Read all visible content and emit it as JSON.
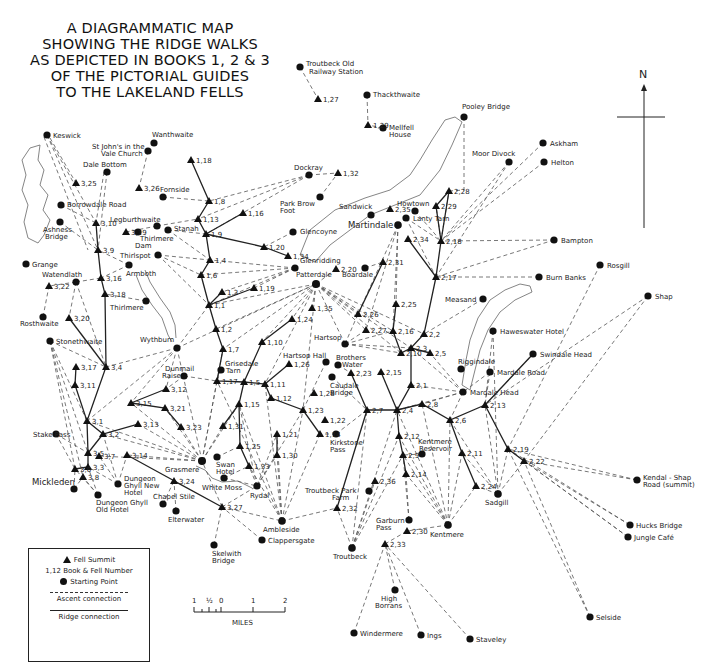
{
  "title": {
    "lines": [
      "A DIAGRAMMATIC MAP",
      "SHOWING THE RIDGE WALKS",
      "AS DEPICTED IN BOOKS 1, 2 & 3",
      "OF THE PICTORIAL GUIDES",
      "TO THE LAKELAND FELLS"
    ]
  },
  "compass": {
    "label": "N",
    "icon": "north-arrow-icon"
  },
  "legend": {
    "fell_summit": "Fell Summit",
    "book_fell_number": "1,12 Book & Fell Number",
    "starting_point": "Starting Point",
    "ascent_connection": "Ascent connection",
    "ridge_connection": "Ridge connection"
  },
  "scale": {
    "ticks": [
      "1",
      "½",
      "0",
      "1",
      "2"
    ],
    "unit": "MILES"
  },
  "colors": {
    "ink": "#111111",
    "paper": "#ffffff",
    "dash": "#555555",
    "water": "#777777"
  },
  "starting_points": [
    {
      "id": "troutbeck_old_station",
      "name": "Troutbeck Old Railway Station",
      "x": 300,
      "y": 67
    },
    {
      "id": "thackthwaite",
      "name": "Thackthwaite",
      "x": 367,
      "y": 95
    },
    {
      "id": "mellfell_house",
      "name": "Mellfell House",
      "x": 383,
      "y": 128
    },
    {
      "id": "pooley_bridge",
      "name": "Pooley Bridge",
      "x": 464,
      "y": 117
    },
    {
      "id": "askham",
      "name": "Askham",
      "x": 543,
      "y": 143
    },
    {
      "id": "helton",
      "name": "Helton",
      "x": 544,
      "y": 162
    },
    {
      "id": "moor_divock",
      "name": "Moor Divock",
      "x": 509,
      "y": 162
    },
    {
      "id": "keswick",
      "name": "Keswick",
      "x": 47,
      "y": 135
    },
    {
      "id": "wanthwaite",
      "name": "Wanthwaite",
      "x": 154,
      "y": 143
    },
    {
      "id": "st_johns",
      "name": "St John's in the Vale Church",
      "x": 148,
      "y": 151
    },
    {
      "id": "dale_bottom",
      "name": "Dale Bottom",
      "x": 107,
      "y": 172
    },
    {
      "id": "fornside",
      "name": "Fornside",
      "x": 163,
      "y": 197
    },
    {
      "id": "dockray",
      "name": "Dockray",
      "x": 309,
      "y": 175
    },
    {
      "id": "park_brow_foot",
      "name": "Park Brow Foot",
      "x": 320,
      "y": 197
    },
    {
      "id": "borrowdale_road",
      "name": "Borrowdale Road",
      "x": 61,
      "y": 205
    },
    {
      "id": "ashness_bridge",
      "name": "Ashness Bridge",
      "x": 60,
      "y": 222
    },
    {
      "id": "legburthwaite",
      "name": "Legburthwaite",
      "x": 157,
      "y": 226
    },
    {
      "id": "stanah",
      "name": "Stanah",
      "x": 168,
      "y": 230
    },
    {
      "id": "thirlmere_dam",
      "name": "Thirlmere Dam",
      "x": 138,
      "y": 232
    },
    {
      "id": "thirlspot",
      "name": "Thirlspot",
      "x": 158,
      "y": 255
    },
    {
      "id": "armboth",
      "name": "Armboth",
      "x": 129,
      "y": 265
    },
    {
      "id": "grange",
      "name": "Grange",
      "x": 26,
      "y": 264
    },
    {
      "id": "watendlath",
      "name": "Watendlath",
      "x": 76,
      "y": 282
    },
    {
      "id": "thirlmere",
      "name": "Thirlmere",
      "x": 146,
      "y": 301
    },
    {
      "id": "rosthwaite",
      "name": "Rosthwaite",
      "x": 43,
      "y": 317
    },
    {
      "id": "stonethwaite",
      "name": "Stonethwaite",
      "x": 50,
      "y": 341
    },
    {
      "id": "wythburn",
      "name": "Wythburn",
      "x": 177,
      "y": 348
    },
    {
      "id": "dunmail_raise",
      "name": "Dunmail Raise",
      "x": 184,
      "y": 376
    },
    {
      "id": "glencoyne",
      "name": "Glencoyne",
      "x": 293,
      "y": 232
    },
    {
      "id": "glenridding",
      "name": "Glenridding",
      "x": 295,
      "y": 268
    },
    {
      "id": "patterdale",
      "name": "Patterdale",
      "x": 316,
      "y": 284
    },
    {
      "id": "sandwick",
      "name": "Sandwick",
      "x": 371,
      "y": 215
    },
    {
      "id": "martindale",
      "name": "Martindale",
      "x": 398,
      "y": 225
    },
    {
      "id": "howtown",
      "name": "Howtown",
      "x": 415,
      "y": 211
    },
    {
      "id": "lanty_tarn",
      "name": "Lanty Tarn",
      "x": 406,
      "y": 218
    },
    {
      "id": "boardale",
      "name": "Boardale",
      "x": 365,
      "y": 268
    },
    {
      "id": "bampton",
      "name": "Bampton",
      "x": 554,
      "y": 240
    },
    {
      "id": "burn_banks",
      "name": "Burn Banks",
      "x": 539,
      "y": 277
    },
    {
      "id": "rosgill",
      "name": "Rosgill",
      "x": 600,
      "y": 265
    },
    {
      "id": "shap",
      "name": "Shap",
      "x": 648,
      "y": 296
    },
    {
      "id": "measand",
      "name": "Measand",
      "x": 483,
      "y": 299
    },
    {
      "id": "haweswater_hotel",
      "name": "Haweswater Hotel",
      "x": 493,
      "y": 331
    },
    {
      "id": "swindale_head",
      "name": "Swindale Head",
      "x": 533,
      "y": 354
    },
    {
      "id": "riggindale",
      "name": "Riggindale",
      "x": 461,
      "y": 369
    },
    {
      "id": "mardale_road",
      "name": "Mardale Road",
      "x": 490,
      "y": 372
    },
    {
      "id": "mardale_head",
      "name": "Mardale Head",
      "x": 463,
      "y": 392
    },
    {
      "id": "hartsop",
      "name": "Hartsop",
      "x": 345,
      "y": 344
    },
    {
      "id": "hartsop_hall",
      "name": "Hartsop Hall",
      "x": 326,
      "y": 362
    },
    {
      "id": "brothers_water",
      "name": "Brothers Water",
      "x": 338,
      "y": 365
    },
    {
      "id": "caudale_bridge",
      "name": "Caudale Bridge",
      "x": 332,
      "y": 377
    },
    {
      "id": "grisedale_tarn",
      "name": "Grisedale Tarn",
      "x": 221,
      "y": 370
    },
    {
      "id": "kirkstone_pass",
      "name": "Kirkstone Pass",
      "x": 336,
      "y": 434
    },
    {
      "id": "kentmere_reservoir",
      "name": "Kentmere Reservoir",
      "x": 422,
      "y": 454
    },
    {
      "id": "stake_pass",
      "name": "Stake Pass",
      "x": 56,
      "y": 434
    },
    {
      "id": "grasmere",
      "name": "Grasmere",
      "x": 202,
      "y": 461
    },
    {
      "id": "swan_hotel",
      "name": "Swan Hotel",
      "x": 217,
      "y": 457
    },
    {
      "id": "white_moss",
      "name": "White Moss",
      "x": 224,
      "y": 478
    },
    {
      "id": "rydal",
      "name": "Rydal",
      "x": 257,
      "y": 486
    },
    {
      "id": "mickleden",
      "name": "Mickleden",
      "x": 74,
      "y": 489
    },
    {
      "id": "dungeon_ghyll_new",
      "name": "Dungeon Ghyll New Hotel",
      "x": 118,
      "y": 484
    },
    {
      "id": "dungeon_ghyll_old",
      "name": "Dungeon Ghyll Old Hotel",
      "x": 98,
      "y": 495
    },
    {
      "id": "chapel_stile",
      "name": "Chapel Stile",
      "x": 163,
      "y": 504
    },
    {
      "id": "elterwater",
      "name": "Elterwater",
      "x": 176,
      "y": 511
    },
    {
      "id": "troutbeck_park",
      "name": "Troutbeck Park Farm",
      "x": 369,
      "y": 491
    },
    {
      "id": "sadgill",
      "name": "Sadgill",
      "x": 498,
      "y": 494
    },
    {
      "id": "garburn_pass",
      "name": "Garburn Pass",
      "x": 409,
      "y": 520
    },
    {
      "id": "kentmere",
      "name": "Kentmere",
      "x": 448,
      "y": 525
    },
    {
      "id": "ambleside",
      "name": "Ambleside",
      "x": 282,
      "y": 521
    },
    {
      "id": "clappersgate",
      "name": "Clappersgate",
      "x": 262,
      "y": 540
    },
    {
      "id": "troutbeck",
      "name": "Troutbeck",
      "x": 352,
      "y": 548
    },
    {
      "id": "skelwith_bridge",
      "name": "Skelwith Bridge",
      "x": 214,
      "y": 545
    },
    {
      "id": "kendal_shap",
      "name": "Kendal - Shap Road (summit)",
      "x": 637,
      "y": 480
    },
    {
      "id": "hucks_bridge",
      "name": "Hucks Bridge",
      "x": 630,
      "y": 525
    },
    {
      "id": "jungle_cafe",
      "name": "Jungle Café",
      "x": 628,
      "y": 537
    },
    {
      "id": "high_borrans",
      "name": "High Borrans",
      "x": 395,
      "y": 590
    },
    {
      "id": "windermere",
      "name": "Windermere",
      "x": 354,
      "y": 633
    },
    {
      "id": "ings",
      "name": "Ings",
      "x": 421,
      "y": 635
    },
    {
      "id": "staveley",
      "name": "Staveley",
      "x": 470,
      "y": 639
    },
    {
      "id": "selside",
      "name": "Selside",
      "x": 590,
      "y": 617
    }
  ],
  "fell_summits": [
    {
      "id": "1,27",
      "x": 318,
      "y": 99
    },
    {
      "id": "1,29",
      "x": 368,
      "y": 125
    },
    {
      "id": "2,28",
      "x": 449,
      "y": 191
    },
    {
      "id": "2,29",
      "x": 436,
      "y": 206
    },
    {
      "id": "2,35",
      "x": 390,
      "y": 209
    },
    {
      "id": "1,32",
      "x": 338,
      "y": 173
    },
    {
      "id": "1,18",
      "x": 191,
      "y": 160
    },
    {
      "id": "3,25",
      "x": 76,
      "y": 183
    },
    {
      "id": "3,26",
      "x": 139,
      "y": 188
    },
    {
      "id": "1,8",
      "x": 209,
      "y": 201
    },
    {
      "id": "1,16",
      "x": 243,
      "y": 213
    },
    {
      "id": "1,13",
      "x": 198,
      "y": 219
    },
    {
      "id": "1,9",
      "x": 206,
      "y": 234
    },
    {
      "id": "3,10",
      "x": 96,
      "y": 223
    },
    {
      "id": "3,19",
      "x": 126,
      "y": 232
    },
    {
      "id": "3,9",
      "x": 98,
      "y": 250
    },
    {
      "id": "1,4",
      "x": 210,
      "y": 260
    },
    {
      "id": "1,20",
      "x": 264,
      "y": 247
    },
    {
      "id": "1,34",
      "x": 288,
      "y": 256
    },
    {
      "id": "3,16",
      "x": 101,
      "y": 278
    },
    {
      "id": "1,6",
      "x": 201,
      "y": 275
    },
    {
      "id": "2,20",
      "x": 336,
      "y": 269
    },
    {
      "id": "2,31",
      "x": 383,
      "y": 262
    },
    {
      "id": "2,34",
      "x": 408,
      "y": 239
    },
    {
      "id": "2,18",
      "x": 441,
      "y": 241
    },
    {
      "id": "2,17",
      "x": 436,
      "y": 277
    },
    {
      "id": "3,22",
      "x": 49,
      "y": 286
    },
    {
      "id": "3,18",
      "x": 105,
      "y": 294
    },
    {
      "id": "1,3",
      "x": 222,
      "y": 292
    },
    {
      "id": "1,19",
      "x": 254,
      "y": 288
    },
    {
      "id": "1,1",
      "x": 209,
      "y": 305
    },
    {
      "id": "1,35",
      "x": 312,
      "y": 308
    },
    {
      "id": "2,25",
      "x": 396,
      "y": 304
    },
    {
      "id": "2,26",
      "x": 358,
      "y": 314
    },
    {
      "id": "3,20",
      "x": 69,
      "y": 318
    },
    {
      "id": "1,2",
      "x": 216,
      "y": 329
    },
    {
      "id": "1,24",
      "x": 292,
      "y": 319
    },
    {
      "id": "2,27",
      "x": 366,
      "y": 330
    },
    {
      "id": "2,16",
      "x": 393,
      "y": 331
    },
    {
      "id": "2,2",
      "x": 424,
      "y": 334
    },
    {
      "id": "1,10",
      "x": 262,
      "y": 342
    },
    {
      "id": "2,3",
      "x": 411,
      "y": 348
    },
    {
      "id": "2,10",
      "x": 401,
      "y": 353
    },
    {
      "id": "2,5",
      "x": 430,
      "y": 353
    },
    {
      "id": "1,7",
      "x": 223,
      "y": 349
    },
    {
      "id": "3,17",
      "x": 76,
      "y": 367
    },
    {
      "id": "3,4",
      "x": 106,
      "y": 367
    },
    {
      "id": "1,26",
      "x": 289,
      "y": 364
    },
    {
      "id": "2,23",
      "x": 351,
      "y": 373
    },
    {
      "id": "2,15",
      "x": 381,
      "y": 372
    },
    {
      "id": "1,5",
      "x": 244,
      "y": 382
    },
    {
      "id": "1,17",
      "x": 217,
      "y": 381
    },
    {
      "id": "3,11",
      "x": 75,
      "y": 385
    },
    {
      "id": "1,11",
      "x": 265,
      "y": 384
    },
    {
      "id": "2,1",
      "x": 411,
      "y": 385
    },
    {
      "id": "3,12",
      "x": 166,
      "y": 389
    },
    {
      "id": "1,28",
      "x": 314,
      "y": 393
    },
    {
      "id": "1,12",
      "x": 271,
      "y": 398
    },
    {
      "id": "3,15",
      "x": 131,
      "y": 403
    },
    {
      "id": "3,21",
      "x": 165,
      "y": 408
    },
    {
      "id": "2,8",
      "x": 422,
      "y": 404
    },
    {
      "id": "1,15",
      "x": 239,
      "y": 404
    },
    {
      "id": "1,23",
      "x": 303,
      "y": 410
    },
    {
      "id": "2,7",
      "x": 367,
      "y": 410
    },
    {
      "id": "2,4",
      "x": 397,
      "y": 410
    },
    {
      "id": "2,13",
      "x": 485,
      "y": 405
    },
    {
      "id": "2,6",
      "x": 450,
      "y": 420
    },
    {
      "id": "3,1",
      "x": 87,
      "y": 421
    },
    {
      "id": "1,22",
      "x": 325,
      "y": 420
    },
    {
      "id": "1,14",
      "x": 320,
      "y": 434
    },
    {
      "id": "3,23",
      "x": 181,
      "y": 427
    },
    {
      "id": "1,31",
      "x": 223,
      "y": 426
    },
    {
      "id": "1,21",
      "x": 277,
      "y": 434
    },
    {
      "id": "2,12",
      "x": 399,
      "y": 436
    },
    {
      "id": "2,11",
      "x": 462,
      "y": 453
    },
    {
      "id": "3,13",
      "x": 138,
      "y": 424
    },
    {
      "id": "3,2",
      "x": 103,
      "y": 434
    },
    {
      "id": "1,25",
      "x": 240,
      "y": 446
    },
    {
      "id": "2,19",
      "x": 508,
      "y": 449
    },
    {
      "id": "2,22",
      "x": 524,
      "y": 461
    },
    {
      "id": "1,30",
      "x": 277,
      "y": 455
    },
    {
      "id": "2,9",
      "x": 403,
      "y": 455
    },
    {
      "id": "3,14",
      "x": 127,
      "y": 455
    },
    {
      "id": "3,5",
      "x": 88,
      "y": 453
    },
    {
      "id": "3,7",
      "x": 99,
      "y": 456
    },
    {
      "id": "1,33",
      "x": 249,
      "y": 466
    },
    {
      "id": "3,6",
      "x": 75,
      "y": 469
    },
    {
      "id": "3,3",
      "x": 88,
      "y": 467
    },
    {
      "id": "3,8",
      "x": 83,
      "y": 477
    },
    {
      "id": "2,14",
      "x": 406,
      "y": 474
    },
    {
      "id": "2,36",
      "x": 375,
      "y": 481
    },
    {
      "id": "3,24",
      "x": 174,
      "y": 481
    },
    {
      "id": "2,24",
      "x": 476,
      "y": 486
    },
    {
      "id": "3,27",
      "x": 222,
      "y": 507
    },
    {
      "id": "2,32",
      "x": 337,
      "y": 508
    },
    {
      "id": "2,30",
      "x": 407,
      "y": 531
    },
    {
      "id": "2,33",
      "x": 385,
      "y": 544
    }
  ]
}
